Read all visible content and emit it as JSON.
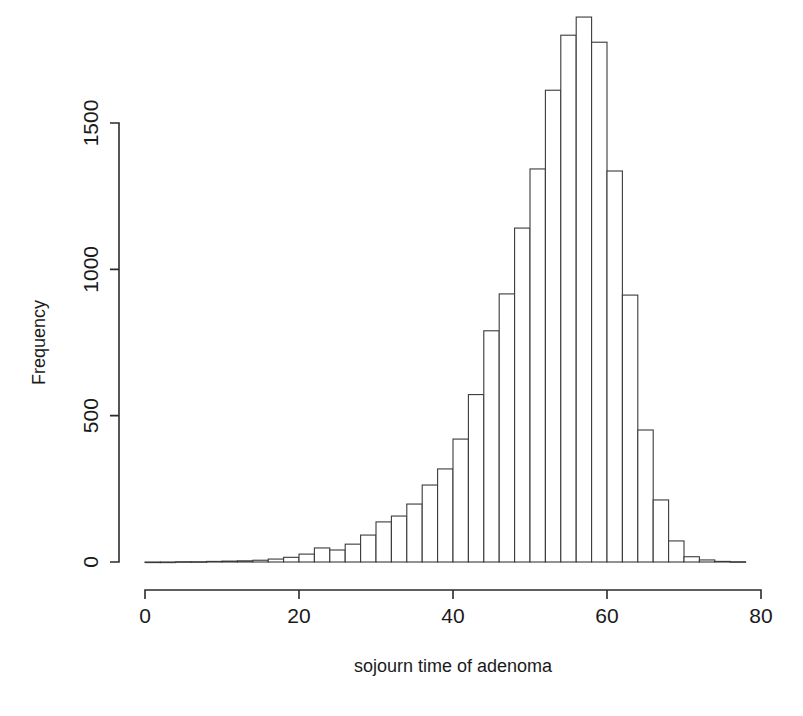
{
  "chart_data": {
    "type": "bar",
    "subtype": "histogram",
    "title": "",
    "xlabel": "sojourn time of adenoma",
    "ylabel": "Frequency",
    "xlim": [
      0,
      78
    ],
    "ylim": [
      0,
      1870
    ],
    "grid": false,
    "legend": null,
    "bin_width": 2,
    "x_ticks": [
      0,
      20,
      40,
      60,
      80
    ],
    "x_tick_labels": [
      "0",
      "20",
      "40",
      "60",
      "80"
    ],
    "y_ticks": [
      0,
      500,
      1000,
      1500
    ],
    "y_tick_labels": [
      "0",
      "500",
      "1000",
      "1500"
    ],
    "bin_starts": [
      0,
      2,
      4,
      6,
      8,
      10,
      12,
      14,
      16,
      18,
      20,
      22,
      24,
      26,
      28,
      30,
      32,
      34,
      36,
      38,
      40,
      42,
      44,
      46,
      48,
      50,
      52,
      54,
      56,
      58,
      60,
      62,
      64,
      66,
      68,
      70,
      72,
      74,
      76
    ],
    "categories": [
      "0-2",
      "2-4",
      "4-6",
      "6-8",
      "8-10",
      "10-12",
      "12-14",
      "14-16",
      "16-18",
      "18-20",
      "20-22",
      "22-24",
      "24-26",
      "26-28",
      "28-30",
      "30-32",
      "32-34",
      "34-36",
      "36-38",
      "38-40",
      "40-42",
      "42-44",
      "44-46",
      "46-48",
      "48-50",
      "50-52",
      "52-54",
      "54-56",
      "56-58",
      "58-60",
      "60-62",
      "62-64",
      "64-66",
      "66-68",
      "68-70",
      "70-72",
      "72-74",
      "74-76",
      "76-78"
    ],
    "values": [
      0,
      0,
      1,
      1,
      2,
      3,
      4,
      6,
      10,
      16,
      27,
      48,
      41,
      61,
      92,
      137,
      157,
      198,
      263,
      318,
      420,
      572,
      790,
      916,
      1141,
      1343,
      1612,
      1800,
      1862,
      1776,
      1336,
      912,
      451,
      212,
      72,
      18,
      7,
      2,
      1
    ]
  },
  "axis_titles": {
    "x": "sojourn time of adenoma",
    "y": "Frequency"
  },
  "colors": {
    "bar_fill": "#ffffff",
    "bar_stroke": "#3a3a3a",
    "axis": "#2b2b2b",
    "text": "#1a1a1a",
    "background": "#ffffff"
  }
}
